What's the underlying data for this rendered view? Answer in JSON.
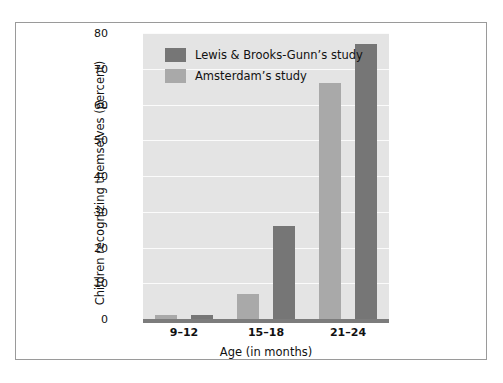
{
  "chart_data": {
    "type": "bar",
    "title": "",
    "xlabel": "Age (in months)",
    "ylabel": "Children recognizing themselves (percent)",
    "categories": [
      "9–12",
      "15–18",
      "21–24"
    ],
    "ylim": [
      0,
      80
    ],
    "ytick_step": 10,
    "yticks": [
      "80",
      "70",
      "60",
      "50",
      "40",
      "30",
      "20",
      "10",
      "0"
    ],
    "grid": true,
    "legend_position": "inside top-left",
    "series": [
      {
        "name": "Lewis & Brooks-Gunn’s study",
        "color": "#767676",
        "values": [
          1,
          26,
          77
        ]
      },
      {
        "name": "Amsterdam’s study",
        "color": "#a9a9a9",
        "values": [
          1,
          7,
          66
        ]
      }
    ]
  },
  "legend": {
    "entries": [
      {
        "label": "Lewis & Brooks-Gunn’s study",
        "swatch": "series-dark"
      },
      {
        "label": "Amsterdam’s study",
        "swatch": "series-light"
      }
    ]
  },
  "colors": {
    "plot_background": "#e4e4e4",
    "gridline": "#fbfbfb",
    "axis_line": "#7c7c7c",
    "frame": "#9a9a9a",
    "page_background": "#ffffff",
    "series_dark": "#767676",
    "series_light": "#a9a9a9"
  }
}
